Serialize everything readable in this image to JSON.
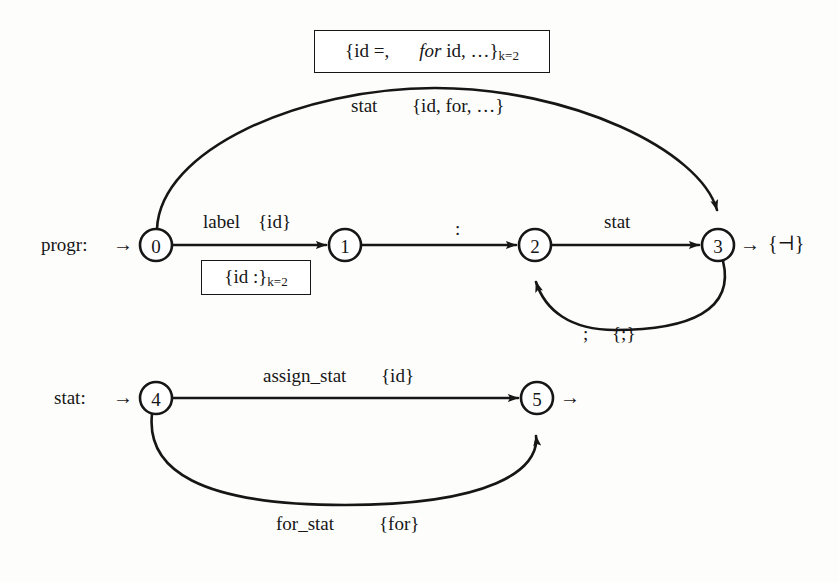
{
  "figure": {
    "kind": "recursive-transition-network",
    "title": "",
    "ink_color": "#161616",
    "background_color": "#fdfdfc"
  },
  "graphs": [
    {
      "name": "progr:",
      "entry_arrow": "→",
      "exit_arrow": "→",
      "exit_set": "{⊣}",
      "nodes": [
        {
          "id": "0",
          "label": "0",
          "cx": 156,
          "cy": 245,
          "r": 16
        },
        {
          "id": "1",
          "label": "1",
          "cx": 345,
          "cy": 245,
          "r": 16
        },
        {
          "id": "2",
          "label": "2",
          "cx": 535,
          "cy": 245,
          "r": 16
        },
        {
          "id": "3",
          "label": "3",
          "cx": 718,
          "cy": 245,
          "r": 16
        }
      ],
      "edges": [
        {
          "from": "0",
          "to": "1",
          "symbol": "label",
          "follow_set": "{id}",
          "lookahead_box": "{id :}",
          "lookahead_k_sub": "k=2",
          "shape": "straight"
        },
        {
          "from": "1",
          "to": "2",
          "symbol": ":",
          "follow_set": "",
          "shape": "straight"
        },
        {
          "from": "2",
          "to": "3",
          "symbol": "stat",
          "follow_set": "",
          "shape": "straight"
        },
        {
          "from": "0",
          "to": "3",
          "symbol": "stat",
          "follow_set": "{id, for, …}",
          "lookahead_box_parts": [
            "{id =,",
            "for",
            "id, …}"
          ],
          "lookahead_k_sub": "k=2",
          "shape": "arc-over"
        },
        {
          "from": "3",
          "to": "2",
          "symbol": ";",
          "follow_set": "{;}",
          "shape": "arc-under"
        }
      ]
    },
    {
      "name": "stat:",
      "entry_arrow": "→",
      "exit_arrow": "→",
      "exit_set": "",
      "nodes": [
        {
          "id": "4",
          "label": "4",
          "cx": 156,
          "cy": 398,
          "r": 16
        },
        {
          "id": "5",
          "label": "5",
          "cx": 537,
          "cy": 398,
          "r": 16
        }
      ],
      "edges": [
        {
          "from": "4",
          "to": "5",
          "symbol": "assign_stat",
          "follow_set": "{id}",
          "shape": "straight"
        },
        {
          "from": "4",
          "to": "5",
          "symbol": "for_stat",
          "follow_set": "{for}",
          "shape": "arc-under"
        }
      ]
    }
  ],
  "labels": {
    "top_box_part1": "{id =,",
    "top_box_italic": "for",
    "top_box_part2": "id, …}",
    "top_box_sub": "k=2",
    "arc_over_symbol": "stat",
    "arc_over_set": "{id, for, …}",
    "progr_name": "progr:",
    "progr_entry_arrow": "→",
    "edge01_symbol": "label",
    "edge01_set": "{id}",
    "small_box_text": "{id :}",
    "small_box_sub": "k=2",
    "edge12_symbol": ":",
    "edge23_symbol": "stat",
    "progr_exit_arrow": "→",
    "progr_exit_set": "{⊣}",
    "edge32_symbol": ";",
    "edge32_set": "{;}",
    "stat_name": "stat:",
    "stat_entry_arrow": "→",
    "edge45_symbol": "assign_stat",
    "edge45_set": "{id}",
    "stat_exit_arrow": "→",
    "edge45b_symbol": "for_stat",
    "edge45b_set": "{for}"
  }
}
